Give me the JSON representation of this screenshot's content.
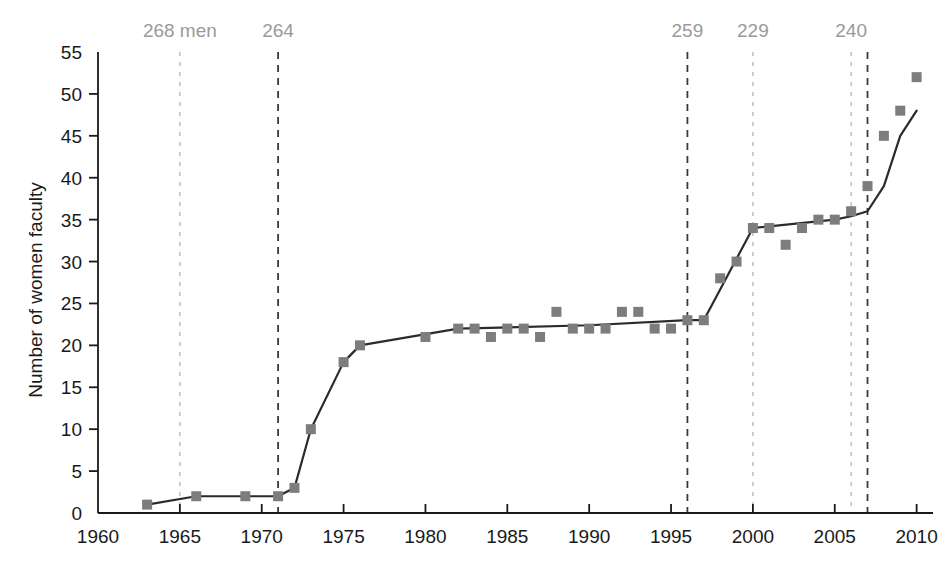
{
  "chart_data": {
    "type": "line",
    "title": "",
    "subtitle": "",
    "xlabel": "",
    "ylabel": "Number of women faculty",
    "xlim": [
      1960,
      2011
    ],
    "ylim": [
      0,
      55
    ],
    "xticks": [
      1960,
      1965,
      1970,
      1975,
      1980,
      1985,
      1990,
      1995,
      2000,
      2005,
      2010
    ],
    "yticks": [
      0,
      5,
      10,
      15,
      20,
      25,
      30,
      35,
      40,
      45,
      50,
      55
    ],
    "grid": false,
    "legend": null,
    "marker": "square",
    "marker_color": "#7d7d7d",
    "line_color": "#2b2b2b",
    "series": [
      {
        "name": "Number of women faculty",
        "x": [
          1963,
          1966,
          1969,
          1971,
          1972,
          1973,
          1975,
          1976,
          1980,
          1982,
          1983,
          1984,
          1985,
          1986,
          1987,
          1988,
          1989,
          1990,
          1991,
          1992,
          1993,
          1994,
          1995,
          1996,
          1997,
          1998,
          1999,
          2000,
          2001,
          2002,
          2003,
          2004,
          2005,
          2006,
          2007,
          2008,
          2009,
          2010
        ],
        "y": [
          1,
          2,
          2,
          2,
          3,
          10,
          18,
          20,
          21,
          22,
          22,
          21,
          22,
          22,
          21,
          24,
          22,
          22,
          22,
          24,
          24,
          22,
          22,
          23,
          23,
          28,
          30,
          34,
          34,
          32,
          34,
          35,
          35,
          36,
          39,
          45,
          48,
          52
        ]
      }
    ],
    "trend_line": {
      "name": "connecting-trend-line",
      "x": [
        1963,
        1966,
        1969,
        1971,
        1972,
        1973,
        1975,
        1976,
        1982,
        1990,
        1996,
        1997,
        2000,
        2005,
        2006,
        2007,
        2008,
        2009,
        2010
      ],
      "y": [
        1,
        2,
        2,
        2,
        3,
        10,
        18,
        20,
        22,
        22.4,
        23,
        23,
        34,
        35,
        35.4,
        36,
        39,
        45,
        48
      ]
    },
    "annotations": [
      {
        "label": "268 men",
        "x": 1965,
        "style": "light-dashed",
        "color": "#b5b5b5"
      },
      {
        "label": "264",
        "x": 1971,
        "style": "dark-dashed",
        "color": "#3a3a3a"
      },
      {
        "label": "259",
        "x": 1996,
        "style": "dark-dashed",
        "color": "#3a3a3a"
      },
      {
        "label": "229",
        "x": 2000,
        "style": "light-dashed",
        "color": "#b5b5b5"
      },
      {
        "label": "240",
        "x": 2006,
        "style": "light-dashed",
        "color": "#b5b5b5"
      },
      {
        "label": "",
        "x": 2007,
        "style": "dark-dashed",
        "color": "#3a3a3a"
      }
    ]
  }
}
